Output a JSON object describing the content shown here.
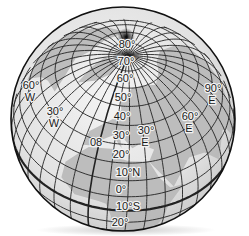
{
  "figure": {
    "type": "globe-graticule",
    "colors": {
      "background": "#ffffff",
      "globe_fill": "#e6e6e6",
      "land_shading": "#b8b8b8",
      "grid_line": "#222222",
      "equator_line": "#111111",
      "label_text": "#1a1a1a"
    },
    "latitude_labels": [
      {
        "text": "80°",
        "x": 127,
        "y": 48
      },
      {
        "text": "70°",
        "x": 126,
        "y": 65
      },
      {
        "text": "60°",
        "x": 125,
        "y": 82
      },
      {
        "text": "50°",
        "x": 123,
        "y": 101
      },
      {
        "text": "40°",
        "x": 122,
        "y": 120
      },
      {
        "text": "30°",
        "x": 121,
        "y": 139
      },
      {
        "text": "20°",
        "x": 121,
        "y": 158
      },
      {
        "text": "10°N",
        "x": 128,
        "y": 176
      },
      {
        "text": "0°",
        "x": 121,
        "y": 193
      },
      {
        "text": "10°S",
        "x": 128,
        "y": 210
      },
      {
        "text": "20°",
        "x": 120,
        "y": 226
      }
    ],
    "longitude_labels": [
      {
        "text": "60°",
        "sub": "W",
        "x": 31,
        "y": 89
      },
      {
        "text": "30°",
        "sub": "W",
        "x": 55,
        "y": 115
      },
      {
        "text": "08",
        "sub": "",
        "x": 96,
        "y": 146
      },
      {
        "text": "30°",
        "sub": "E",
        "x": 146,
        "y": 134
      },
      {
        "text": "60°",
        "sub": "E",
        "x": 190,
        "y": 120
      },
      {
        "text": "90°",
        "sub": "E",
        "x": 213,
        "y": 92
      }
    ]
  }
}
